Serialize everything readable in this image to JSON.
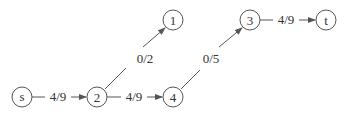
{
  "diagram": {
    "type": "flow-network",
    "nodes": [
      {
        "id": "s",
        "label": "s",
        "x": 22,
        "y": 97
      },
      {
        "id": "2",
        "label": "2",
        "x": 97,
        "y": 97
      },
      {
        "id": "4",
        "label": "4",
        "x": 173,
        "y": 97
      },
      {
        "id": "1",
        "label": "1",
        "x": 173,
        "y": 20
      },
      {
        "id": "3",
        "label": "3",
        "x": 250,
        "y": 20
      },
      {
        "id": "t",
        "label": "t",
        "x": 326,
        "y": 20
      }
    ],
    "edges": [
      {
        "from": "s",
        "to": "2",
        "label": "4/9",
        "flow": 4,
        "capacity": 9
      },
      {
        "from": "2",
        "to": "4",
        "label": "4/9",
        "flow": 4,
        "capacity": 9
      },
      {
        "from": "2",
        "to": "1",
        "label": "0/2",
        "flow": 0,
        "capacity": 2
      },
      {
        "from": "4",
        "to": "3",
        "label": "0/5",
        "flow": 0,
        "capacity": 5
      },
      {
        "from": "3",
        "to": "t",
        "label": "4/9",
        "flow": 4,
        "capacity": 9
      }
    ],
    "colors": {
      "stroke": "#555555",
      "text": "#333333",
      "background": "#ffffff"
    }
  }
}
